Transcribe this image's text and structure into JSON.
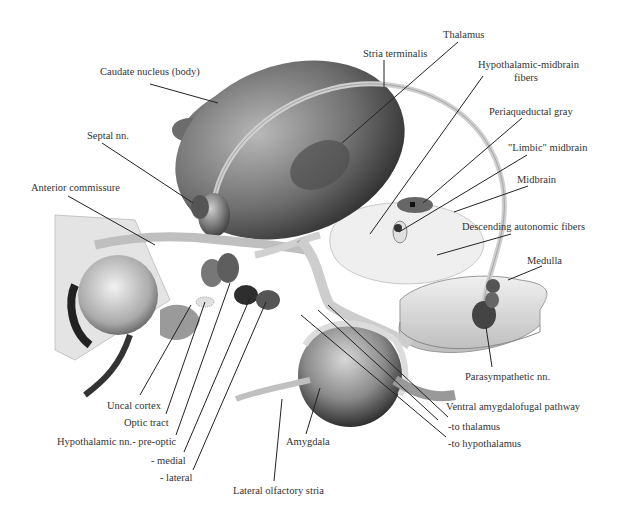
{
  "diagram": {
    "colors": {
      "text": "#333333",
      "leader_line": "#222222",
      "structure_dark": "#3a3a3a",
      "structure_light": "#e6e6e6"
    },
    "labels": [
      {
        "id": "thalamus",
        "text": "Thalamus",
        "x": 443,
        "y": 29
      },
      {
        "id": "stria-terminalis",
        "text": "Stria terminalis",
        "x": 363,
        "y": 48
      },
      {
        "id": "caudate-nucleus",
        "text": "Caudate nucleus (body)",
        "x": 100,
        "y": 66
      },
      {
        "id": "hypothalamic-midbrain-fibers-1",
        "text": "Hypothalamic-midbrain",
        "x": 478,
        "y": 59
      },
      {
        "id": "hypothalamic-midbrain-fibers-2",
        "text": "fibers",
        "x": 514,
        "y": 72
      },
      {
        "id": "periaqueductal-gray",
        "text": "Periaqueductal gray",
        "x": 489,
        "y": 106
      },
      {
        "id": "septal-nn",
        "text": "Septal nn.",
        "x": 87,
        "y": 130
      },
      {
        "id": "limbic-midbrain",
        "text": "\"Limbic\" midbrain",
        "x": 508,
        "y": 142
      },
      {
        "id": "midbrain",
        "text": "Midbrain",
        "x": 517,
        "y": 174
      },
      {
        "id": "anterior-commissure",
        "text": "Anterior commissure",
        "x": 31,
        "y": 182
      },
      {
        "id": "descending-autonomic-fibers",
        "text": "Descending autonomic fibers",
        "x": 462,
        "y": 221
      },
      {
        "id": "medulla",
        "text": "Medulla",
        "x": 527,
        "y": 255
      },
      {
        "id": "parasympathetic-nn",
        "text": "Parasympathetic nn.",
        "x": 465,
        "y": 371
      },
      {
        "id": "uncal-cortex",
        "text": "Uncal cortex",
        "x": 107,
        "y": 400
      },
      {
        "id": "optic-tract",
        "text": "Optic tract",
        "x": 124,
        "y": 417
      },
      {
        "id": "ventral-amygdalofugal-pathway",
        "text": "Ventral amygdalofugal pathway",
        "x": 446,
        "y": 401
      },
      {
        "id": "to-thalamus",
        "text": "-to thalamus",
        "x": 448,
        "y": 421
      },
      {
        "id": "hypothalamic-nn-preoptic",
        "text": "Hypothalamic nn.- pre-optic",
        "x": 57,
        "y": 436
      },
      {
        "id": "amygdala",
        "text": "Amygdala",
        "x": 286,
        "y": 436
      },
      {
        "id": "to-hypothalamus",
        "text": "-to hypothalamus",
        "x": 448,
        "y": 438
      },
      {
        "id": "medial",
        "text": "- medial",
        "x": 151,
        "y": 455
      },
      {
        "id": "lateral",
        "text": "- lateral",
        "x": 160,
        "y": 472
      },
      {
        "id": "lateral-olfactory-stria",
        "text": "Lateral olfactory stria",
        "x": 233,
        "y": 485
      }
    ]
  }
}
